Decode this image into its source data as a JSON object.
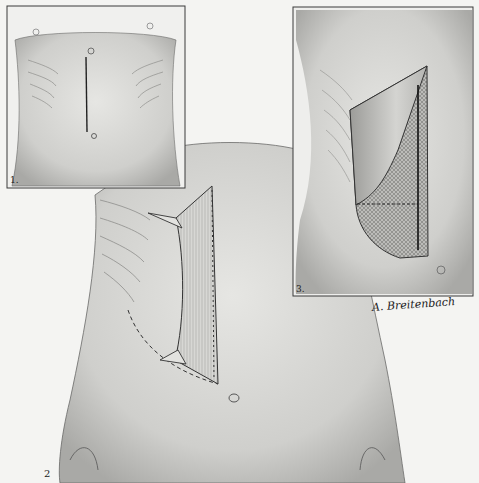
{
  "figure": {
    "panels": [
      {
        "id": 1,
        "label": "1.",
        "content": "Front torso with midline upper abdominal incision from xiphoid to navel"
      },
      {
        "id": 2,
        "label": "2",
        "content": "Torso with retracted subcostal flap incision, dashed curve outlining extension"
      },
      {
        "id": 3,
        "label": "3.",
        "content": "Close-up of opened flap with cross-hatched exposed tissue and dashed line"
      }
    ],
    "signature": "A. Breitenbach",
    "colors": {
      "background": "#f4f4f2",
      "ink": "#2a2a2a",
      "shading": "#bdbdbb",
      "frame": "#3a3a3a"
    }
  }
}
